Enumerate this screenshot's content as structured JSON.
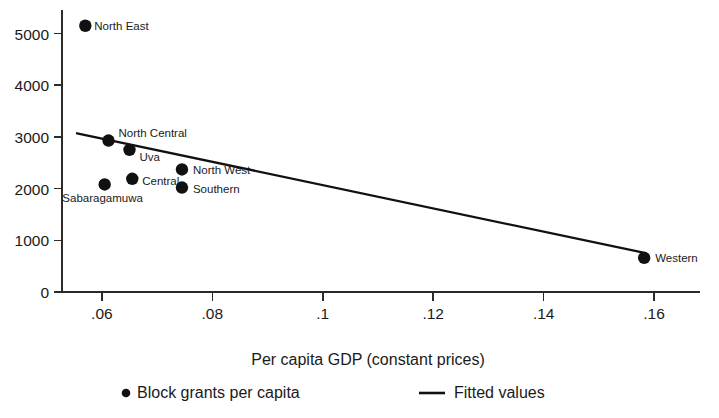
{
  "chart_data": {
    "type": "scatter",
    "title": "",
    "subtitle": "",
    "xlabel": "Per capita GDP (constant prices)",
    "ylabel": "",
    "xlim": [
      0.0535,
      0.1665
    ],
    "ylim": [
      0,
      5300
    ],
    "grid": false,
    "legend_position": "bottom",
    "xticks": [
      0.06,
      0.08,
      0.1,
      0.12,
      0.14,
      0.16
    ],
    "xtick_labels": [
      ".06",
      ".08",
      ".1",
      ".12",
      ".14",
      ".16"
    ],
    "yticks": [
      0,
      1000,
      2000,
      3000,
      4000,
      5000
    ],
    "ytick_labels": [
      "0",
      "1000",
      "2000",
      "3000",
      "4000",
      "5000"
    ],
    "series": [
      {
        "name": "Block grants per capita",
        "type": "scatter",
        "marker": "filled-circle",
        "color": "#111111",
        "points": [
          {
            "label": "North East",
            "x": 0.057,
            "y": 5150,
            "label_dx": 9,
            "label_dy": 4,
            "anchor": "start"
          },
          {
            "label": "North Central",
            "x": 0.0612,
            "y": 2930,
            "label_dx": 10,
            "label_dy": -4,
            "anchor": "start"
          },
          {
            "label": "Uva",
            "x": 0.065,
            "y": 2750,
            "label_dx": 10,
            "label_dy": 11,
            "anchor": "start"
          },
          {
            "label": "Sabaragamuwa",
            "x": 0.0605,
            "y": 2080,
            "label_dx": -2,
            "label_dy": 18,
            "anchor": "middle"
          },
          {
            "label": "Central",
            "x": 0.0655,
            "y": 2190,
            "label_dx": 10,
            "label_dy": 6,
            "anchor": "start"
          },
          {
            "label": "North West",
            "x": 0.0745,
            "y": 2370,
            "label_dx": 11,
            "label_dy": 5,
            "anchor": "start"
          },
          {
            "label": "Southern",
            "x": 0.0745,
            "y": 2020,
            "label_dx": 11,
            "label_dy": 5,
            "anchor": "start"
          },
          {
            "label": "Western",
            "x": 0.1582,
            "y": 660,
            "label_dx": 11,
            "label_dy": 4,
            "anchor": "start"
          }
        ]
      },
      {
        "name": "Fitted values",
        "type": "line",
        "color": "#111111",
        "x": [
          0.0555,
          0.1585
        ],
        "y": [
          3070,
          750
        ]
      }
    ],
    "legend": [
      {
        "label": "Block grants per capita",
        "marker": "filled-circle"
      },
      {
        "label": "Fitted values",
        "marker": "line"
      }
    ]
  }
}
